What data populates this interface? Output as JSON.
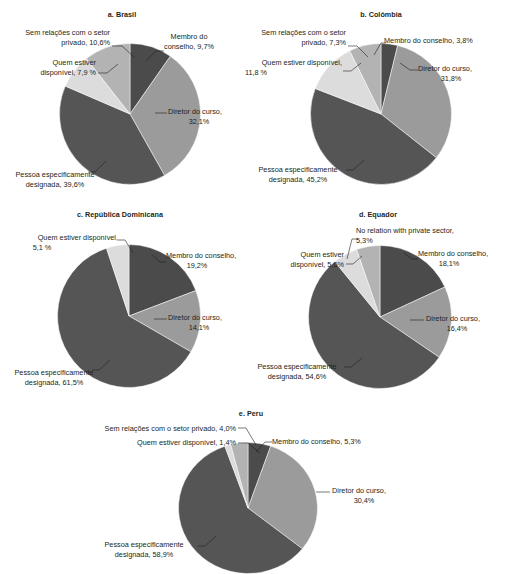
{
  "palette": {
    "membro": "#4b4b4b",
    "diretor": "#9b9b9b",
    "pessoa": "#555555",
    "quem": "#dcdcdc",
    "sem": "#b3b3b3",
    "text": "#231f20",
    "background": "#ffffff"
  },
  "chart_data": [
    {
      "type": "pie",
      "id": "brasil",
      "title": "a. Brasil",
      "labels": [
        "Membro do conselho",
        "Diretor do curso",
        "Pessoa especificamente designada",
        "Quem estiver disponível",
        "Sem relações com o setor privado"
      ],
      "values": [
        9.7,
        32.1,
        39.6,
        7.9,
        10.6
      ],
      "annotations": [
        "Membro do conselho, 9,7%",
        "Diretor do curso,|32,1%",
        "Pessoa especificamente|designada, 39,6%",
        "Quem estiver|disponível, 7,9 %",
        "Sem relações com o setor|privado, 10,6%"
      ]
    },
    {
      "type": "pie",
      "id": "colombia",
      "title": "b. Colômbia",
      "labels": [
        "Membro do conselho",
        "Diretor do curso",
        "Pessoa especificamente designada",
        "Quem estiver disponível",
        "Sem relações com o setor privado"
      ],
      "values": [
        3.8,
        31.8,
        45.2,
        11.8,
        7.3
      ],
      "annotations": [
        "Membro do conselho, 3,8%",
        "Diretor do curso,|31,8%",
        "Pessoa especificamente|designada, 45,2%",
        "Quem estiver disponível,|11,8 %",
        "Sem relações com o setor|privado, 7,3%"
      ]
    },
    {
      "type": "pie",
      "id": "republica-dominicana",
      "title": "c. República Dominicana",
      "labels": [
        "Membro do conselho",
        "Diretor do curso",
        "Pessoa especificamente designada",
        "Quem estiver disponível"
      ],
      "values": [
        19.2,
        14.1,
        61.5,
        5.1
      ],
      "annotations": [
        "Membro do conselho,|19,2%",
        "Diretor do curso,|14,1%",
        "Pessoa especificamente|designada, 61,5%",
        "Quem estiver disponível,|5,1 %"
      ]
    },
    {
      "type": "pie",
      "id": "equador",
      "title": "d. Equador",
      "labels": [
        "Membro do conselho",
        "Diretor do curso",
        "Pessoa especificamente designada",
        "Quem estiver disponível",
        "No relation with private sector"
      ],
      "values": [
        18.1,
        16.4,
        54.6,
        5.6,
        5.3
      ],
      "annotations": [
        "Membro do conselho,|18,1%",
        "Diretor do curso,|16,4%",
        "Pessoa especificamente|designada, 54,6%",
        "Quem estiver|disponível, 5,6%",
        "No relation with private sector,|5,3%"
      ]
    },
    {
      "type": "pie",
      "id": "peru",
      "title": "e. Peru",
      "labels": [
        "Membro do conselho",
        "Diretor do curso",
        "Pessoa especificamente designada",
        "Quem estiver disponível",
        "Sem relações com o setor privado"
      ],
      "values": [
        5.3,
        30.4,
        58.9,
        1.4,
        4.0
      ],
      "annotations": [
        "Membro do conselho, 5,3%",
        "Diretor do curso,|30,4%",
        "Pessoa especificamente|designada, 58,9%",
        "Quem estiver disponível, 1,4%",
        "Sem relações com o setor privado, 4,0%"
      ]
    }
  ],
  "charts": {
    "a": {
      "title": "a. Brasil",
      "membro_l1": "Membro do",
      "membro_l2": "conselho, 9,7%",
      "diretor_l1": "Diretor do curso,",
      "diretor_l2": "32,1%",
      "pessoa_l1": "Pessoa especificamente",
      "pessoa_l2": "designada, 39,6%",
      "quem_l1": "Quem estiver",
      "quem_l2": "disponível, 7,9 %",
      "sem_l1": "Sem relações com o setor",
      "sem_l2": "privado, 10,6%"
    },
    "b": {
      "title": "b. Colômbia",
      "membro_l1": "Membro do conselho, 3,8%",
      "diretor_l1": "Diretor do curso,",
      "diretor_l2": "31,8%",
      "pessoa_l1": "Pessoa especificamente",
      "pessoa_l2": "designada, 45,2%",
      "quem_l1": "Quem estiver disponível,",
      "quem_l2": "11,8 %",
      "sem_l1": "Sem relações com o setor",
      "sem_l2": "privado, 7,3%"
    },
    "c": {
      "title": "c. República Dominicana",
      "membro_l1": "Membro do conselho,",
      "membro_l2": "19,2%",
      "diretor_l1": "Diretor do curso,",
      "diretor_l2": "14,1%",
      "pessoa_l1": "Pessoa especificamente",
      "pessoa_l2": "designada, 61,5%",
      "quem_l1": "Quem estiver disponível,",
      "quem_l2": "5,1 %"
    },
    "d": {
      "title": "d. Equador",
      "membro_l1": "Membro do conselho,",
      "membro_l2": "18,1%",
      "diretor_l1": "Diretor do curso,",
      "diretor_l2": "16,4%",
      "pessoa_l1": "Pessoa especificamente",
      "pessoa_l2": "designada, 54,6%",
      "quem_l1": "Quem estiver",
      "quem_l2": "disponível, 5,6%",
      "sem_l1": "No relation with private sector,",
      "sem_l2": "5,3%"
    },
    "e": {
      "title": "e. Peru",
      "membro_l1": "Membro do conselho, 5,3%",
      "diretor_l1": "Diretor do curso,",
      "diretor_l2": "30,4%",
      "pessoa_l1": "Pessoa especificamente",
      "pessoa_l2": "designada, 58,9%",
      "quem_l1": "Quem estiver disponível, 1,4%",
      "sem_l1": "Sem relações com o setor privado, 4,0%"
    }
  }
}
